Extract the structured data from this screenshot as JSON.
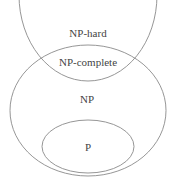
{
  "diagram": {
    "type": "euler-diagram",
    "sets": [
      {
        "id": "np-hard",
        "label": "NP-hard"
      },
      {
        "id": "np-complete",
        "label": "NP-complete"
      },
      {
        "id": "np",
        "label": "NP"
      },
      {
        "id": "p",
        "label": "P"
      }
    ],
    "stroke_color": "#8a8a8a",
    "text_color": "#444444"
  }
}
